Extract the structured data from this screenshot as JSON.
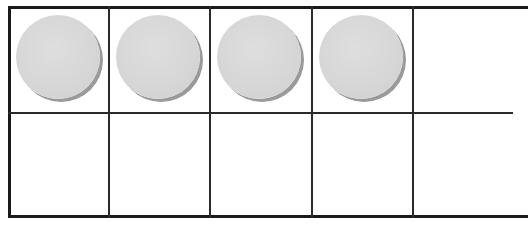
{
  "ten_frame": {
    "rows": 2,
    "columns": 5,
    "filled_count": 4,
    "counter_color": "#d8d8d8",
    "line_color": "#1a1a1a",
    "cells": [
      {
        "row": 0,
        "col": 0,
        "filled": true
      },
      {
        "row": 0,
        "col": 1,
        "filled": true
      },
      {
        "row": 0,
        "col": 2,
        "filled": true
      },
      {
        "row": 0,
        "col": 3,
        "filled": true
      },
      {
        "row": 0,
        "col": 4,
        "filled": false
      },
      {
        "row": 1,
        "col": 0,
        "filled": false
      },
      {
        "row": 1,
        "col": 1,
        "filled": false
      },
      {
        "row": 1,
        "col": 2,
        "filled": false
      },
      {
        "row": 1,
        "col": 3,
        "filled": false
      },
      {
        "row": 1,
        "col": 4,
        "filled": false
      }
    ]
  }
}
